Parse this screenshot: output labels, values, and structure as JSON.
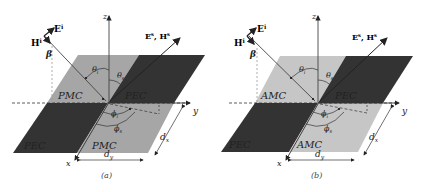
{
  "colors": {
    "pmc": "#a6a6a6",
    "amc": "#c6c6c6",
    "pec": "#333333",
    "axis": "#333333"
  },
  "panels": [
    {
      "caption": "(a)",
      "materials": {
        "top_left": "PMC",
        "top_right": "PEC",
        "bottom_left": "PEC",
        "bottom_right": "PMC"
      },
      "light_material_type": "PMC"
    },
    {
      "caption": "(b)",
      "materials": {
        "top_left": "AMC",
        "top_right": "PEC",
        "bottom_left": "PEC",
        "bottom_right": "AMC"
      },
      "light_material_type": "AMC"
    }
  ],
  "labels": {
    "axis_z": "z",
    "axis_x": "x",
    "axis_y": "y",
    "incident_E": "E",
    "incident_E_sup": "i",
    "incident_H": "H",
    "incident_H_sup": "i",
    "scattered": "E",
    "scattered_sup": "s",
    "scattered_H": ", H",
    "scattered_H_sup": "s",
    "beta": "β",
    "theta_i": "θ",
    "theta_i_sub": "i",
    "theta_s": "θ",
    "theta_s_sub": "s",
    "phi_i": "ϕ",
    "phi_i_sub": "i",
    "phi_s": "ϕ",
    "phi_s_sub": "s",
    "dx": "d",
    "dx_sub": "x",
    "dy": "d",
    "dy_sub": "y"
  }
}
